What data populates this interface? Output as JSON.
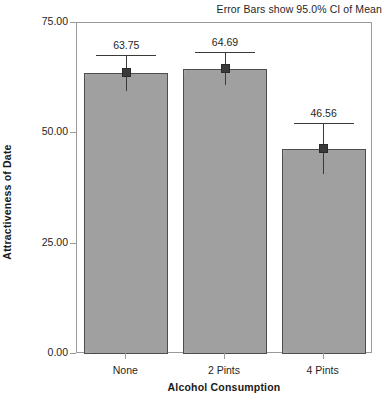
{
  "chart_data": {
    "type": "bar",
    "title": "",
    "annotation": "Error Bars show 95.0% CI of Mean",
    "xlabel": "Alcohol Consumption",
    "ylabel": "Attractiveness of Date",
    "categories": [
      "None",
      "2 Pints",
      "4 Pints"
    ],
    "values": [
      63.75,
      64.69,
      46.56
    ],
    "value_labels": [
      "63.75",
      "64.69",
      "46.56"
    ],
    "error_bars": {
      "kind": "95.0% CI of Mean",
      "upper": [
        67.85,
        68.39,
        52.41
      ],
      "lower": [
        59.65,
        60.99,
        40.71
      ]
    },
    "ylim": [
      0.0,
      75.0
    ],
    "ytick_values": [
      0.0,
      25.0,
      50.0,
      75.0
    ],
    "ytick_labels": [
      "0.00",
      "25.00",
      "50.00",
      "75.00"
    ],
    "grid": false,
    "legend": "none",
    "bar_color": "#a9a9a9",
    "bar_edge_color": "#4d4d4d",
    "error_color": "#3a3a3a",
    "frame_color": "#9a9a9a"
  }
}
